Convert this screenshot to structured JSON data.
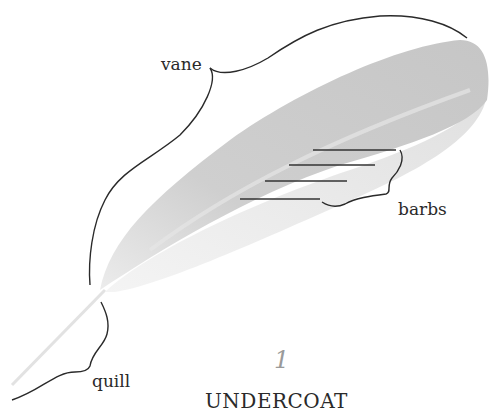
{
  "diagram": {
    "title": "UNDERCOAT",
    "step_number": "1",
    "labels": {
      "vane": "vane",
      "barbs": "barbs",
      "quill": "quill"
    },
    "colors": {
      "feather_fill": "#c8c8c8",
      "feather_light": "#e4e4e4",
      "line": "#2a2a2a",
      "step_number": "#9a9a9a"
    }
  }
}
